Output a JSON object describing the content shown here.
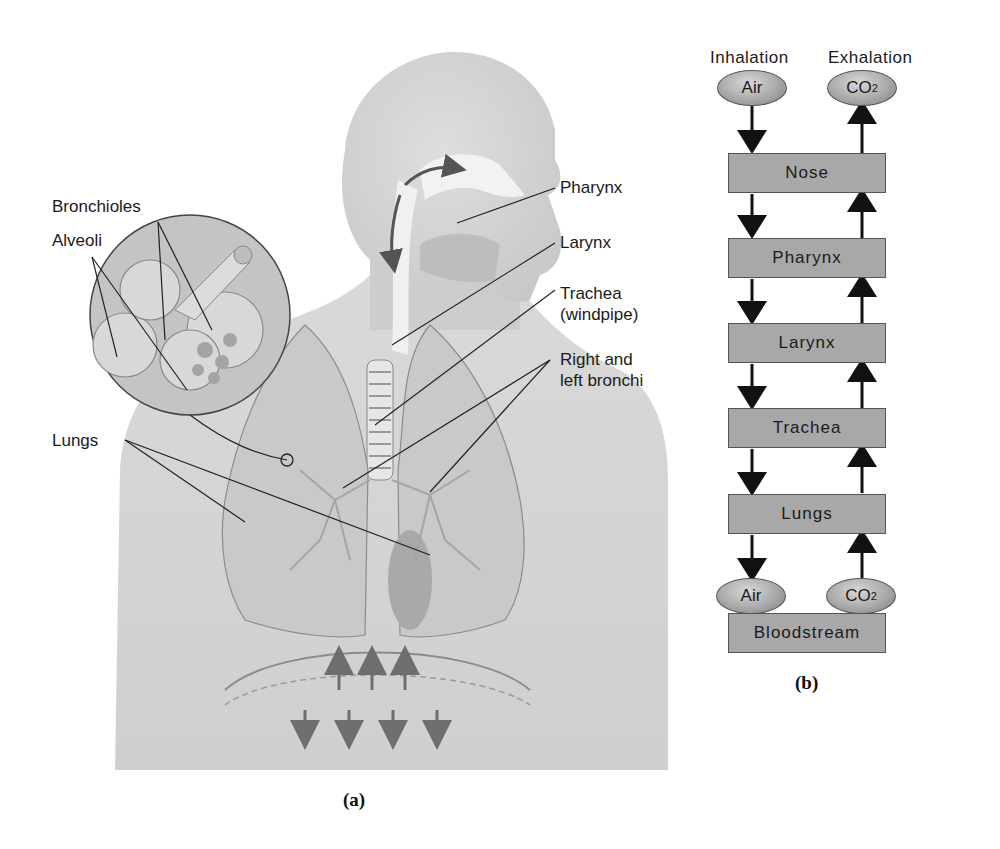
{
  "figure_a": {
    "caption": "(a)",
    "labels": {
      "bronchioles": "Bronchioles",
      "alveoli": "Alveoli",
      "lungs": "Lungs",
      "pharynx": "Pharynx",
      "larynx": "Larynx",
      "trachea_line1": "Trachea",
      "trachea_line2": "(windpipe)",
      "bronchi_line1": "Right and",
      "bronchi_line2": "left bronchi"
    }
  },
  "figure_b": {
    "caption": "(b)",
    "header_inhalation": "Inhalation",
    "header_exhalation": "Exhalation",
    "top_left_oval": "Air",
    "top_right_oval_base": "CO",
    "top_right_oval_sub": "2",
    "boxes": [
      "Nose",
      "Pharynx",
      "Larynx",
      "Trachea",
      "Lungs"
    ],
    "bottom_left_oval": "Air",
    "bottom_right_oval_base": "CO",
    "bottom_right_oval_sub": "2",
    "bottom_box": "Bloodstream"
  },
  "colors": {
    "box_fill": "#a8a8a8",
    "box_border": "#555555",
    "body_fill": "#d4d4d4",
    "lung_fill": "#c6c6c6",
    "arrow": "#111111",
    "diaphragm_arrow": "#6e6e6e"
  }
}
